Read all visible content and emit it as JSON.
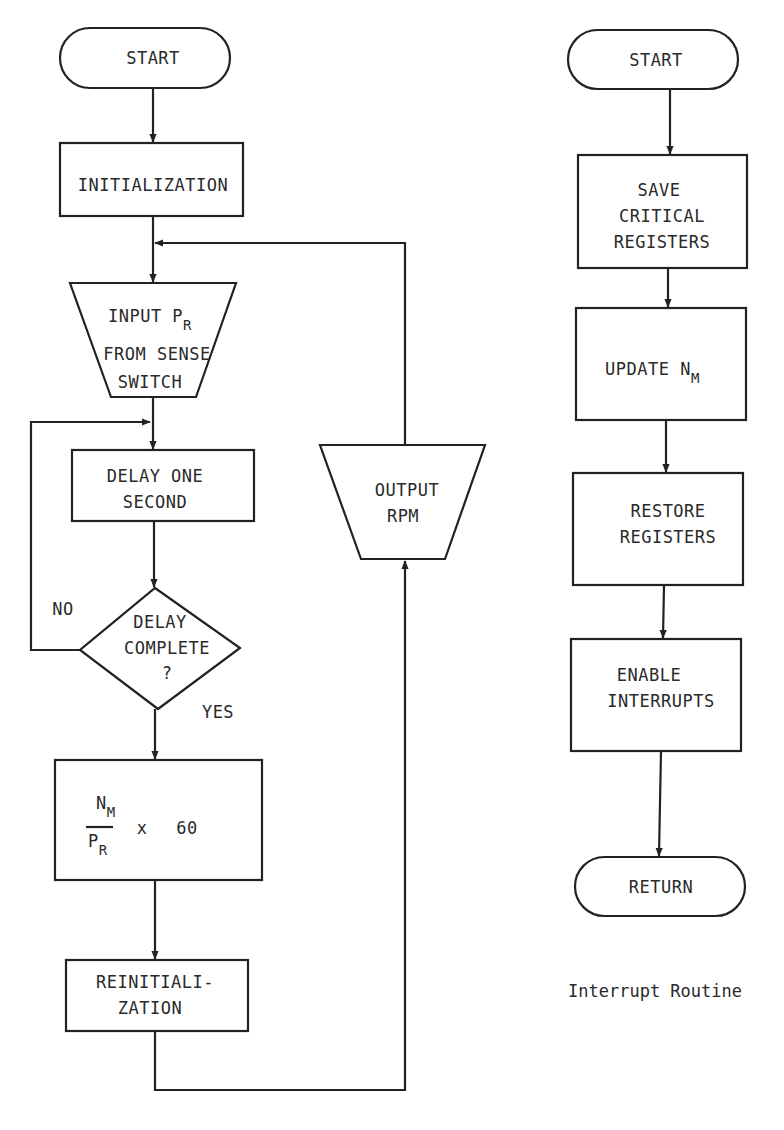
{
  "main_flowchart": {
    "start": {
      "label": "START"
    },
    "initialization": {
      "label": "INITIALIZATION"
    },
    "input": {
      "line1_main": "INPUT P",
      "line1_sub": "R",
      "line2": "FROM SENSE",
      "line3": "SWITCH"
    },
    "delay": {
      "line1": "DELAY ONE",
      "line2": "SECOND"
    },
    "decision": {
      "line1": "DELAY",
      "line2": "COMPLETE",
      "line3": "?",
      "no_label": "NO",
      "yes_label": "YES"
    },
    "compute": {
      "numerator_main": "N",
      "numerator_sub": "M",
      "denominator_main": "P",
      "denominator_sub": "R",
      "operator": "x",
      "constant": "60"
    },
    "reinitialization": {
      "line1": "REINITIALI-",
      "line2": "ZATION"
    },
    "output": {
      "line1": "OUTPUT",
      "line2": "RPM"
    }
  },
  "interrupt_routine": {
    "start": {
      "label": "START"
    },
    "save": {
      "line1": "SAVE",
      "line2": "CRITICAL",
      "line3": "REGISTERS"
    },
    "update": {
      "main": "UPDATE N",
      "sub": "M"
    },
    "restore": {
      "line1": "RESTORE",
      "line2": "REGISTERS"
    },
    "enable": {
      "line1": "ENABLE",
      "line2": "INTERRUPTS"
    },
    "return": {
      "label": "RETURN"
    },
    "caption": "Interrupt Routine"
  }
}
